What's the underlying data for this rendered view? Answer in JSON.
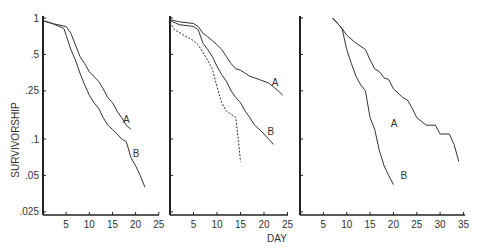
{
  "chart_data": [
    {
      "type": "line",
      "panel": 1,
      "ylabel": "SURVIVORSHIP",
      "xlabel": "",
      "yscale": "log",
      "yticks": [
        "1",
        ".5",
        ".25",
        ".1",
        ".05",
        ".025"
      ],
      "ytick_values": [
        1,
        0.5,
        0.25,
        0.1,
        0.05,
        0.025
      ],
      "xticks": [
        5,
        10,
        15,
        20,
        25
      ],
      "xlim": [
        0,
        25
      ],
      "ylim": [
        0.025,
        1
      ],
      "series": [
        {
          "name": "A",
          "style": "solid",
          "x": [
            0,
            2,
            5,
            6,
            7,
            8,
            9,
            10,
            12,
            13,
            14,
            15,
            16,
            17,
            18,
            19
          ],
          "y": [
            0.95,
            0.9,
            0.85,
            0.75,
            0.6,
            0.48,
            0.42,
            0.36,
            0.3,
            0.26,
            0.22,
            0.2,
            0.17,
            0.15,
            0.13,
            0.12
          ]
        },
        {
          "name": "B",
          "style": "solid",
          "x": [
            0,
            2,
            4.5,
            5,
            6,
            7,
            8,
            9,
            10,
            11,
            12,
            13,
            14,
            15,
            16,
            17,
            18,
            19,
            20,
            21,
            22
          ],
          "y": [
            0.95,
            0.9,
            0.82,
            0.72,
            0.55,
            0.45,
            0.35,
            0.28,
            0.23,
            0.2,
            0.18,
            0.15,
            0.13,
            0.12,
            0.11,
            0.1,
            0.095,
            0.07,
            0.06,
            0.05,
            0.04
          ]
        }
      ]
    },
    {
      "type": "line",
      "panel": 2,
      "xlabel": "DAY",
      "yscale": "log",
      "xticks": [
        5,
        10,
        15,
        20,
        25
      ],
      "xlim": [
        0,
        25
      ],
      "ylim": [
        0.025,
        1
      ],
      "series": [
        {
          "name": "A",
          "style": "solid",
          "x": [
            0,
            2,
            5,
            6,
            7,
            8,
            9,
            10,
            11,
            12,
            13,
            14,
            15,
            16,
            17,
            18,
            19,
            20,
            21,
            22,
            23,
            24
          ],
          "y": [
            0.97,
            0.93,
            0.9,
            0.85,
            0.75,
            0.7,
            0.65,
            0.6,
            0.55,
            0.48,
            0.42,
            0.38,
            0.37,
            0.35,
            0.33,
            0.32,
            0.31,
            0.3,
            0.29,
            0.27,
            0.25,
            0.23
          ]
        },
        {
          "name": "B",
          "style": "solid",
          "x": [
            0,
            2,
            5,
            6,
            7,
            8,
            9,
            10,
            11,
            12,
            13,
            14,
            15,
            16,
            17,
            18,
            19,
            20,
            21,
            22
          ],
          "y": [
            0.95,
            0.88,
            0.85,
            0.8,
            0.62,
            0.55,
            0.48,
            0.4,
            0.34,
            0.3,
            0.25,
            0.22,
            0.2,
            0.17,
            0.15,
            0.13,
            0.12,
            0.11,
            0.1,
            0.09
          ]
        },
        {
          "name": "",
          "style": "dashed",
          "x": [
            0,
            1,
            3,
            5,
            6,
            7,
            8,
            9,
            10,
            11,
            12,
            13,
            14,
            14.5,
            15
          ],
          "y": [
            0.92,
            0.8,
            0.72,
            0.65,
            0.6,
            0.52,
            0.45,
            0.38,
            0.27,
            0.2,
            0.17,
            0.16,
            0.15,
            0.1,
            0.065
          ]
        }
      ]
    },
    {
      "type": "line",
      "panel": 3,
      "xlabel": "",
      "yscale": "log",
      "xticks": [
        5,
        10,
        15,
        20,
        25,
        30,
        35
      ],
      "xlim": [
        0,
        35
      ],
      "ylim": [
        0.025,
        1
      ],
      "series": [
        {
          "name": "A",
          "style": "solid",
          "x": [
            7,
            9,
            10,
            12,
            14,
            15,
            16,
            17,
            18,
            19,
            20,
            21,
            22,
            23,
            24,
            25,
            26,
            27,
            28,
            29,
            30,
            31,
            32,
            33,
            34
          ],
          "y": [
            1.0,
            0.82,
            0.72,
            0.62,
            0.55,
            0.45,
            0.38,
            0.36,
            0.32,
            0.31,
            0.26,
            0.24,
            0.22,
            0.21,
            0.18,
            0.15,
            0.14,
            0.13,
            0.13,
            0.13,
            0.11,
            0.11,
            0.11,
            0.09,
            0.065
          ]
        },
        {
          "name": "B",
          "style": "solid",
          "x": [
            7,
            9,
            10,
            11,
            12,
            13,
            14,
            15,
            16,
            17,
            18,
            19,
            20
          ],
          "y": [
            1.0,
            0.82,
            0.55,
            0.42,
            0.33,
            0.28,
            0.25,
            0.15,
            0.12,
            0.08,
            0.06,
            0.05,
            0.042
          ]
        }
      ]
    }
  ],
  "labels": {
    "ylabel": "SURVIVORSHIP",
    "xlabel": "DAY",
    "series_a": "A",
    "series_b": "B"
  }
}
